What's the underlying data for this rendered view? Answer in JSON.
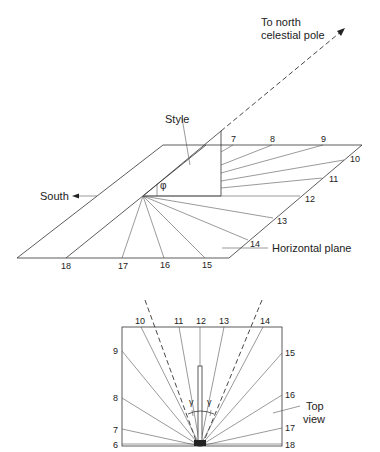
{
  "perspective_view": {
    "labels": {
      "pole": "To north\ncelestial pole",
      "pole_line1": "To north",
      "pole_line2": "celestial pole",
      "style": "Style",
      "south": "South",
      "horizontal_plane": "Horizontal plane",
      "angle_symbol": "φ"
    },
    "hour_marks": [
      "7",
      "8",
      "9",
      "10",
      "11",
      "12",
      "13",
      "14",
      "15",
      "16",
      "17",
      "18"
    ]
  },
  "top_view": {
    "label_line1": "Top",
    "label_line2": "view",
    "angle_symbol": "γ",
    "top_hours": [
      "10",
      "11",
      "12",
      "13",
      "14"
    ],
    "left_hours": [
      "9",
      "8",
      "7",
      "6"
    ],
    "right_hours": [
      "15",
      "16",
      "17",
      "18"
    ]
  }
}
